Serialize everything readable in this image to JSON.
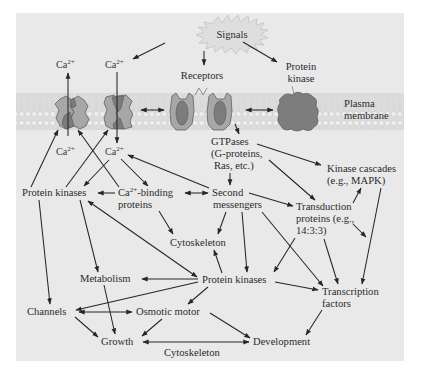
{
  "figure": {
    "colors": {
      "panel_background": "#e9e9e9",
      "membrane_band": "#dcdcdc",
      "channel_light": "#a7a7a7",
      "channel_dark": "#7c7c7c",
      "protein_kinase_membrane": "#7d7d7d",
      "arrow": "#262626",
      "text": "#2b2b2b"
    },
    "membrane_label_line1": "Plasma",
    "membrane_label_line2": "membrane"
  },
  "nodes": {
    "signals": {
      "label": "Signals"
    },
    "ca_out_left": {
      "label": "Ca",
      "sup": "2+"
    },
    "ca_out_right": {
      "label": "Ca",
      "sup": "2+"
    },
    "ca_in_left": {
      "label": "Ca",
      "sup": "2+"
    },
    "ca_in_right": {
      "label": "Ca",
      "sup": "2+"
    },
    "receptors": {
      "label": "Receptors"
    },
    "protein_kinase_top": {
      "line1": "Protein",
      "line2": "kinase"
    },
    "gtpases": {
      "line1": "GTPases",
      "line2": "(G-proteins,",
      "line3": "Ras, etc.)"
    },
    "kinase_cascades": {
      "line1": "Kinase cascades",
      "line2": "(e.g., MAPK)"
    },
    "protein_kinases_left": {
      "label": "Protein kinases"
    },
    "ca_binding": {
      "pre": "Ca",
      "sup": "2+",
      "post": "-binding",
      "line2": "proteins"
    },
    "second_messengers": {
      "line1": "Second",
      "line2": "messengers"
    },
    "transduction_proteins": {
      "line1": "Transduction",
      "line2": "proteins (e.g.,",
      "line3": "14:3:3)"
    },
    "cytoskeleton_mid": {
      "label": "Cytoskeleton"
    },
    "metabolism": {
      "label": "Metabolism"
    },
    "protein_kinases_center": {
      "label": "Protein kinases"
    },
    "transcription_factors": {
      "line1": "Transcription",
      "line2": "factors"
    },
    "channels": {
      "label": "Channels"
    },
    "osmotic_motor": {
      "label": "Osmotic motor"
    },
    "growth": {
      "label": "Growth"
    },
    "development": {
      "label": "Development"
    },
    "cytoskeleton_bottom": {
      "label": "Cytoskeleton"
    }
  },
  "edges": [
    {
      "from": "signals",
      "to": "ca_out_right",
      "type": "arrow"
    },
    {
      "from": "signals",
      "to": "receptors",
      "type": "arrow"
    },
    {
      "from": "signals",
      "to": "protein_kinase_top",
      "type": "arrow"
    },
    {
      "from": "ca_in_left",
      "to": "ca_out_left",
      "type": "arrow",
      "via": "channel 1"
    },
    {
      "from": "ca_out_right",
      "to": "ca_in_right",
      "type": "arrow",
      "via": "channel 2"
    },
    {
      "from": "channel 2",
      "to": "receptor",
      "type": "bidirectional"
    },
    {
      "from": "receptor",
      "to": "protein_kinase_top",
      "type": "bidirectional"
    },
    {
      "from": "receptor",
      "to": "gtpases",
      "type": "arrow"
    },
    {
      "from": "gtpases",
      "to": "second_messengers",
      "type": "arrow"
    },
    {
      "from": "gtpases",
      "to": "kinase_cascades",
      "type": "arrow"
    },
    {
      "from": "gtpases",
      "to": "transduction_proteins",
      "type": "arrow"
    },
    {
      "from": "protein_kinases_left",
      "to": "channel 1",
      "type": "arrow"
    },
    {
      "from": "protein_kinases_left",
      "to": "channel 2",
      "type": "arrow"
    },
    {
      "from": "ca_binding",
      "to": "channel 1",
      "type": "arrow"
    },
    {
      "from": "ca_in_right",
      "to": "protein_kinases_left",
      "type": "arrow"
    },
    {
      "from": "ca_in_right",
      "to": "ca_binding",
      "type": "arrow"
    },
    {
      "from": "second_messengers",
      "to": "ca_in_right",
      "type": "arrow"
    },
    {
      "from": "ca_binding",
      "to": "protein_kinases_left",
      "type": "arrow"
    },
    {
      "from": "ca_binding",
      "to": "second_messengers",
      "type": "bidirectional"
    },
    {
      "from": "ca_binding",
      "to": "cytoskeleton_mid",
      "type": "arrow"
    },
    {
      "from": "second_messengers",
      "to": "transduction_proteins",
      "type": "arrow"
    },
    {
      "from": "second_messengers",
      "to": "cytoskeleton_mid",
      "type": "arrow"
    },
    {
      "from": "second_messengers",
      "to": "protein_kinases_center",
      "type": "arrow"
    },
    {
      "from": "second_messengers",
      "to": "transcription_factors",
      "type": "arrow"
    },
    {
      "from": "transduction_proteins",
      "to": "kinase_cascades",
      "type": "arrow"
    },
    {
      "from": "kinase_cascades",
      "to": "transduction_proteins",
      "type": "arrow"
    },
    {
      "from": "transduction_proteins",
      "to": "protein_kinases_center",
      "type": "arrow"
    },
    {
      "from": "transduction_proteins",
      "to": "transcription_factors",
      "type": "arrow"
    },
    {
      "from": "kinase_cascades",
      "to": "transcription_factors",
      "type": "arrow"
    },
    {
      "from": "protein_kinases_left",
      "to": "metabolism",
      "type": "arrow"
    },
    {
      "from": "protein_kinases_left",
      "to": "channels",
      "type": "arrow"
    },
    {
      "from": "protein_kinases_center",
      "to": "protein_kinases_left",
      "type": "bidirectional"
    },
    {
      "from": "protein_kinases_center",
      "to": "cytoskeleton_mid",
      "type": "arrow"
    },
    {
      "from": "protein_kinases_center",
      "to": "metabolism",
      "type": "arrow"
    },
    {
      "from": "protein_kinases_center",
      "to": "channels",
      "type": "arrow"
    },
    {
      "from": "protein_kinases_center",
      "to": "osmotic_motor",
      "type": "arrow"
    },
    {
      "from": "protein_kinases_center",
      "to": "transcription_factors",
      "type": "arrow"
    },
    {
      "from": "metabolism",
      "to": "growth",
      "type": "arrow"
    },
    {
      "from": "channels",
      "to": "osmotic_motor",
      "type": "bidirectional"
    },
    {
      "from": "channels",
      "to": "growth",
      "type": "arrow"
    },
    {
      "from": "osmotic_motor",
      "to": "growth",
      "type": "arrow"
    },
    {
      "from": "osmotic_motor",
      "to": "development",
      "type": "arrow"
    },
    {
      "from": "transcription_factors",
      "to": "development",
      "type": "arrow"
    },
    {
      "from": "growth",
      "to": "development",
      "type": "bidirectional",
      "label": "Cytoskeleton"
    }
  ]
}
